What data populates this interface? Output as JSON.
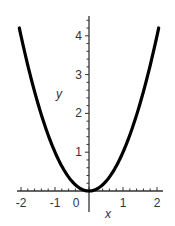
{
  "chart_data": {
    "type": "line",
    "title": "",
    "xlabel": "x",
    "ylabel": "y",
    "function": "y = x^2",
    "xlim": [
      -2.05,
      2.05
    ],
    "ylim": [
      0,
      4.5
    ],
    "x_ticks": [
      -2,
      -1,
      0,
      1,
      2
    ],
    "x_tick_labels": [
      "-2",
      "-1",
      "0",
      "1",
      "2"
    ],
    "y_ticks": [
      1,
      2,
      3,
      4
    ],
    "y_tick_labels": [
      "1",
      "2",
      "3",
      "4"
    ],
    "x_minor_step": 0.2,
    "y_minor_step": 0.2,
    "grid": false,
    "legend": null,
    "series": [
      {
        "name": "x^2",
        "color": "#000000",
        "x": [
          -2.05,
          -2,
          -1.5,
          -1,
          -0.5,
          0,
          0.5,
          1,
          1.5,
          2,
          2.05
        ],
        "y": [
          4.2025,
          4,
          2.25,
          1,
          0.25,
          0,
          0.25,
          1,
          2.25,
          4,
          4.2025
        ]
      }
    ]
  },
  "colors": {
    "axis": "#333333",
    "curve": "#000000",
    "background": "#ffffff"
  }
}
